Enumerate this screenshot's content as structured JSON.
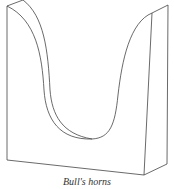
{
  "figure": {
    "caption": "Bull's horns",
    "stroke_color": "#444444"
  }
}
